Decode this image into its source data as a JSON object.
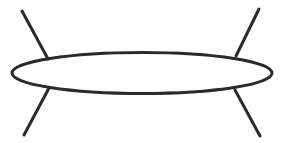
{
  "canvas": {
    "width": 282,
    "height": 143,
    "background_color": "#ffffff"
  },
  "figure": {
    "stroke_color": "#2a2a2a",
    "fill_color": "none"
  },
  "shapes": {
    "ellipse": {
      "name": "central-ellipse",
      "center_x": 142,
      "center_y": 73,
      "radius_x": 130,
      "radius_y": 20.5,
      "stroke_width": 3.0,
      "stroke_color": "#2a2a2a",
      "fill": "none"
    },
    "legs": [
      {
        "name": "upper-left-leg",
        "x1": 22,
        "y1": 11,
        "x2": 48,
        "y2": 59,
        "stroke_width": 3.0,
        "stroke_color": "#2a2a2a"
      },
      {
        "name": "upper-right-leg",
        "x1": 259,
        "y1": 9,
        "x2": 236,
        "y2": 56,
        "stroke_width": 3.0,
        "stroke_color": "#2a2a2a"
      },
      {
        "name": "lower-left-leg",
        "x1": 49,
        "y1": 88,
        "x2": 24,
        "y2": 135,
        "stroke_width": 3.0,
        "stroke_color": "#2a2a2a"
      },
      {
        "name": "lower-right-leg",
        "x1": 235,
        "y1": 90,
        "x2": 260,
        "y2": 136,
        "stroke_width": 3.0,
        "stroke_color": "#2a2a2a"
      }
    ]
  }
}
